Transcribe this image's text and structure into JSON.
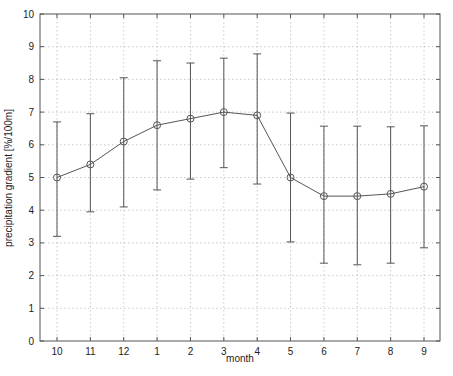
{
  "chart_data": {
    "type": "line",
    "title": "",
    "xlabel": "month",
    "ylabel": "precipitation gradient [%/100m]",
    "categories": [
      "10",
      "11",
      "12",
      "1",
      "2",
      "3",
      "4",
      "5",
      "6",
      "7",
      "8",
      "9"
    ],
    "series": [
      {
        "name": "mean",
        "values": [
          5.0,
          5.4,
          6.1,
          6.6,
          6.8,
          7.0,
          6.9,
          5.0,
          4.43,
          4.43,
          4.5,
          4.72
        ],
        "error_upper": [
          6.7,
          6.95,
          8.05,
          8.57,
          8.5,
          8.65,
          8.78,
          6.97,
          6.57,
          6.57,
          6.55,
          6.58
        ],
        "error_lower": [
          3.2,
          3.95,
          4.1,
          4.62,
          4.95,
          5.3,
          4.8,
          3.03,
          2.38,
          2.33,
          2.38,
          2.85
        ],
        "marker": "open-circle",
        "color": "#555555"
      }
    ],
    "ylim": [
      0,
      10
    ],
    "yticks": [
      0,
      1,
      2,
      3,
      4,
      5,
      6,
      7,
      8,
      9,
      10
    ],
    "grid": true,
    "legend": null
  }
}
